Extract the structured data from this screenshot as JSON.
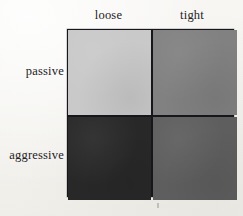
{
  "figure": {
    "type": "2x2-matrix",
    "background_color": "#f5f4f1",
    "border_color": "#17161a",
    "text_color": "#24211f"
  },
  "axes": {
    "column_headers": [
      {
        "label": "loose"
      },
      {
        "label": "tight"
      }
    ],
    "row_headers": [
      {
        "label": "passive"
      },
      {
        "label": "aggressive"
      }
    ]
  },
  "chart_data": {
    "type": "heatmap",
    "title": "",
    "xlabel": "",
    "ylabel": "",
    "categories_x": [
      "loose",
      "tight"
    ],
    "categories_y": [
      "passive",
      "aggressive"
    ],
    "grid": true,
    "legend": "none",
    "cells": [
      {
        "row": "passive",
        "column": "loose",
        "position": "top-left",
        "shade": "light gray",
        "color": "#c9c9c9",
        "value": 0.21
      },
      {
        "row": "passive",
        "column": "tight",
        "position": "top-right",
        "shade": "medium gray",
        "color": "#818181",
        "value": 0.49
      },
      {
        "row": "aggressive",
        "column": "loose",
        "position": "bottom-left",
        "shade": "near black",
        "color": "#282828",
        "value": 0.84
      },
      {
        "row": "aggressive",
        "column": "tight",
        "position": "bottom-right",
        "shade": "dark gray",
        "color": "#5e5e5e",
        "value": 0.63
      }
    ]
  },
  "artifacts": {
    "scan_mark": {
      "visible": true,
      "color": "#b9b7b2"
    }
  }
}
